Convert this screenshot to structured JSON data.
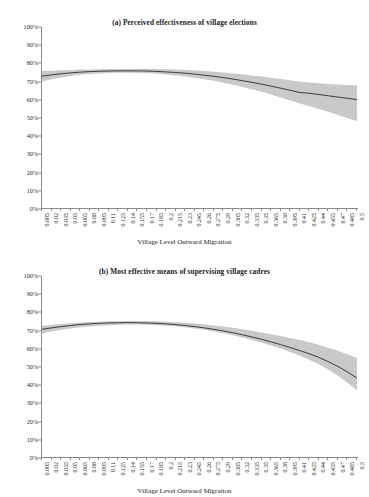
{
  "figure": {
    "x_axis_title": "Village Level Outward Migration",
    "band_color": "#c9c9c9",
    "line_color": "#2b2b2b",
    "axis_color": "#8a8a8a"
  },
  "panels": [
    {
      "id": "a",
      "title": "(a) Perceived effectiveness of village elections"
    },
    {
      "id": "b",
      "title": "(b) Most effective means of supervising village cadres"
    }
  ],
  "chart_data": [
    {
      "type": "line",
      "title": "(a) Perceived effectiveness of village elections",
      "xlabel": "Village Level Outward Migration",
      "ylabel": "",
      "xlim": [
        0.005,
        0.5
      ],
      "ylim": [
        0,
        100
      ],
      "grid": false,
      "legend": "none",
      "ytick_labels": [
        "0%",
        "10%",
        "20%",
        "30%",
        "40%",
        "50%",
        "60%",
        "70%",
        "80%",
        "90%",
        "100%"
      ],
      "ytick_values": [
        0,
        10,
        20,
        30,
        40,
        50,
        60,
        70,
        80,
        90,
        100
      ],
      "xtick_labels": [
        "0.005",
        "0.02",
        "0.035",
        "0.05",
        "0.065",
        "0.08",
        "0.095",
        "0.11",
        "0.125",
        "0.14",
        "0.155",
        "0.17",
        "0.185",
        "0.2",
        "0.215",
        "0.23",
        "0.245",
        "0.26",
        "0.275",
        "0.29",
        "0.305",
        "0.32",
        "0.335",
        "0.35",
        "0.365",
        "0.38",
        "0.395",
        "0.41",
        "0.425",
        "0.44",
        "0.455",
        "0.47",
        "0.485",
        "0.5"
      ],
      "x": [
        0.005,
        0.02,
        0.035,
        0.05,
        0.065,
        0.08,
        0.095,
        0.11,
        0.125,
        0.14,
        0.155,
        0.17,
        0.185,
        0.2,
        0.215,
        0.23,
        0.245,
        0.26,
        0.275,
        0.29,
        0.305,
        0.32,
        0.335,
        0.35,
        0.365,
        0.38,
        0.395,
        0.41,
        0.425,
        0.44,
        0.455,
        0.47,
        0.485,
        0.5
      ],
      "series": [
        {
          "name": "Predicted probability",
          "values": [
            73.0,
            73.7,
            74.3,
            74.8,
            75.2,
            75.5,
            75.7,
            75.8,
            75.9,
            75.9,
            75.9,
            75.8,
            75.6,
            75.3,
            75.0,
            74.6,
            74.1,
            73.5,
            72.9,
            72.2,
            71.4,
            70.5,
            69.6,
            68.6,
            67.5,
            66.4,
            65.2,
            64.0,
            63.6,
            62.9,
            62.2,
            61.5,
            60.8,
            60.1
          ]
        },
        {
          "name": "95% CI upper",
          "values": [
            75.8,
            76.0,
            76.2,
            76.4,
            76.6,
            76.7,
            76.8,
            76.9,
            76.9,
            77.0,
            77.0,
            77.0,
            76.9,
            76.8,
            76.6,
            76.4,
            76.1,
            75.8,
            75.4,
            75.0,
            74.5,
            74.0,
            73.4,
            72.8,
            72.1,
            71.4,
            70.7,
            69.9,
            69.5,
            69.1,
            68.7,
            68.4,
            68.1,
            67.8
          ]
        },
        {
          "name": "95% CI lower",
          "values": [
            70.1,
            71.3,
            72.3,
            73.1,
            73.7,
            74.2,
            74.5,
            74.7,
            74.8,
            74.8,
            74.7,
            74.6,
            74.3,
            73.9,
            73.4,
            72.8,
            72.1,
            71.3,
            70.4,
            69.4,
            68.3,
            67.1,
            65.8,
            64.4,
            62.9,
            61.3,
            59.6,
            57.9,
            56.5,
            55.0,
            53.4,
            51.7,
            50.0,
            48.2
          ]
        }
      ]
    },
    {
      "type": "line",
      "title": "(b) Most effective means of supervising village cadres",
      "xlabel": "Village Level Outward Migration",
      "ylabel": "",
      "xlim": [
        0.005,
        0.5
      ],
      "ylim": [
        0,
        100
      ],
      "grid": false,
      "legend": "none",
      "ytick_labels": [
        "0%",
        "10%",
        "20%",
        "30%",
        "40%",
        "50%",
        "60%",
        "70%",
        "80%",
        "90%",
        "100%"
      ],
      "ytick_values": [
        0,
        10,
        20,
        30,
        40,
        50,
        60,
        70,
        80,
        90,
        100
      ],
      "xtick_labels": [
        "0.005",
        "0.02",
        "0.035",
        "0.05",
        "0.065",
        "0.08",
        "0.095",
        "0.11",
        "0.125",
        "0.14",
        "0.155",
        "0.17",
        "0.185",
        "0.2",
        "0.215",
        "0.23",
        "0.245",
        "0.26",
        "0.275",
        "0.29",
        "0.305",
        "0.32",
        "0.335",
        "0.35",
        "0.365",
        "0.38",
        "0.395",
        "0.41",
        "0.425",
        "0.44",
        "0.455",
        "0.47",
        "0.485",
        "0.5"
      ],
      "x": [
        0.005,
        0.02,
        0.035,
        0.05,
        0.065,
        0.08,
        0.095,
        0.11,
        0.125,
        0.14,
        0.155,
        0.17,
        0.185,
        0.2,
        0.215,
        0.23,
        0.245,
        0.26,
        0.275,
        0.29,
        0.305,
        0.32,
        0.335,
        0.35,
        0.365,
        0.38,
        0.395,
        0.41,
        0.425,
        0.44,
        0.455,
        0.47,
        0.485,
        0.5
      ],
      "series": [
        {
          "name": "Predicted probability",
          "values": [
            70.7,
            71.5,
            72.2,
            72.8,
            73.3,
            73.7,
            74.0,
            74.2,
            74.3,
            74.4,
            74.3,
            74.2,
            74.0,
            73.7,
            73.3,
            72.8,
            72.2,
            71.5,
            70.7,
            69.8,
            68.8,
            67.7,
            66.5,
            65.2,
            63.8,
            62.3,
            60.7,
            59.0,
            57.3,
            55.3,
            52.9,
            50.3,
            47.3,
            43.9
          ]
        },
        {
          "name": "95% CI upper",
          "values": [
            72.6,
            73.1,
            73.6,
            74.0,
            74.4,
            74.7,
            74.9,
            75.1,
            75.2,
            75.3,
            75.3,
            75.2,
            75.1,
            74.9,
            74.6,
            74.3,
            73.9,
            73.4,
            72.8,
            72.2,
            71.5,
            70.7,
            69.9,
            69.0,
            68.0,
            67.0,
            65.9,
            64.8,
            63.6,
            62.2,
            60.6,
            58.9,
            57.0,
            54.9
          ]
        },
        {
          "name": "95% CI lower",
          "values": [
            68.4,
            69.5,
            70.4,
            71.2,
            71.8,
            72.3,
            72.7,
            73.0,
            73.2,
            73.3,
            73.3,
            73.2,
            73.0,
            72.7,
            72.3,
            71.8,
            71.2,
            70.4,
            69.5,
            68.5,
            67.4,
            66.2,
            64.9,
            63.4,
            61.8,
            60.1,
            58.2,
            56.2,
            54.0,
            51.5,
            48.5,
            45.2,
            41.4,
            37.2
          ]
        }
      ]
    }
  ]
}
